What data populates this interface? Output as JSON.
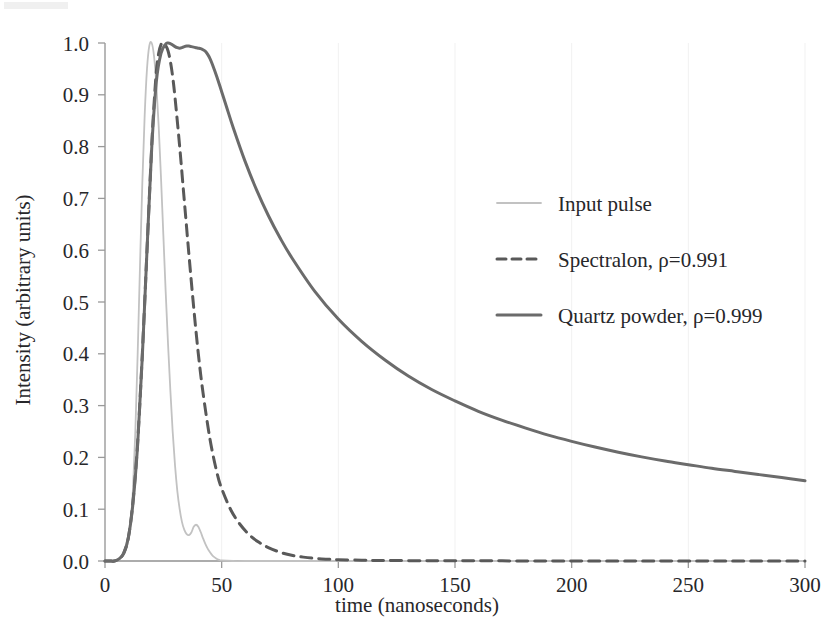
{
  "chart_data": {
    "type": "line",
    "title": "",
    "xlabel": "time (nanoseconds)",
    "ylabel": "Intensity (arbitrary units)",
    "xlim": [
      0,
      300
    ],
    "ylim": [
      0.0,
      1.0
    ],
    "grid": true,
    "legend_position": "upper right inside",
    "x_tick_labels": [
      "0",
      "50",
      "100",
      "150",
      "200",
      "250",
      "300"
    ],
    "x_ticks": [
      0,
      50,
      100,
      150,
      200,
      250,
      300
    ],
    "y_tick_labels": [
      "0.0",
      "0.1",
      "0.2",
      "0.3",
      "0.4",
      "0.5",
      "0.6",
      "0.7",
      "0.8",
      "0.9",
      "1.0"
    ],
    "y_ticks": [
      0.0,
      0.1,
      0.2,
      0.3,
      0.4,
      0.5,
      0.6,
      0.7,
      0.8,
      0.9,
      1.0
    ],
    "series": [
      {
        "name": "Input pulse",
        "style": "solid",
        "color": "#c2c2c2",
        "width": 1.8,
        "x": [
          0,
          2,
          4,
          6,
          8,
          9,
          10,
          11,
          12,
          13,
          14,
          15,
          16,
          17,
          18,
          19,
          20,
          21,
          22,
          23,
          24,
          25,
          26,
          27,
          28,
          29,
          30,
          31,
          32,
          33,
          34,
          35,
          36,
          37,
          38,
          39,
          40,
          41,
          42,
          43,
          44,
          45,
          46,
          47,
          48,
          49,
          50,
          55,
          60,
          80,
          120,
          200,
          300
        ],
        "y": [
          0.0,
          0.0,
          0.0,
          0.003,
          0.012,
          0.022,
          0.04,
          0.075,
          0.14,
          0.25,
          0.4,
          0.57,
          0.73,
          0.86,
          0.95,
          0.995,
          1.0,
          0.975,
          0.92,
          0.84,
          0.74,
          0.63,
          0.52,
          0.42,
          0.33,
          0.25,
          0.185,
          0.135,
          0.1,
          0.075,
          0.06,
          0.052,
          0.05,
          0.055,
          0.066,
          0.07,
          0.066,
          0.056,
          0.044,
          0.033,
          0.024,
          0.017,
          0.011,
          0.007,
          0.004,
          0.002,
          0.001,
          0.0,
          0.0,
          0.0,
          0.0,
          0.0,
          0.0
        ]
      },
      {
        "name": "Spectralon, ρ=0.991",
        "style": "dashed",
        "color": "#595959",
        "width": 3.0,
        "x": [
          0,
          2,
          4,
          6,
          8,
          10,
          12,
          14,
          16,
          18,
          20,
          21,
          22,
          23,
          24,
          25,
          26,
          27,
          28,
          29,
          30,
          32,
          34,
          36,
          38,
          40,
          42,
          45,
          48,
          50,
          54,
          58,
          62,
          66,
          70,
          75,
          80,
          85,
          90,
          95,
          100,
          110,
          120,
          140,
          160,
          180,
          200,
          220,
          240,
          260,
          280,
          300
        ],
        "y": [
          0.0,
          0.0,
          0.0,
          0.004,
          0.015,
          0.045,
          0.115,
          0.23,
          0.4,
          0.6,
          0.8,
          0.88,
          0.945,
          0.98,
          0.997,
          1.0,
          0.995,
          0.985,
          0.965,
          0.935,
          0.895,
          0.8,
          0.695,
          0.59,
          0.49,
          0.4,
          0.325,
          0.235,
          0.17,
          0.14,
          0.098,
          0.07,
          0.05,
          0.036,
          0.026,
          0.017,
          0.011,
          0.0075,
          0.005,
          0.0035,
          0.0025,
          0.0015,
          0.001,
          0.0005,
          0.0003,
          0.0002,
          0.0001,
          0.0001,
          0.0,
          0.0,
          0.0,
          0.0
        ]
      },
      {
        "name": "Quartz powder, ρ=0.999",
        "style": "solid",
        "color": "#6b6b6b",
        "width": 3.0,
        "x": [
          0,
          2,
          4,
          6,
          8,
          10,
          12,
          14,
          16,
          18,
          20,
          22,
          24,
          26,
          27,
          28,
          29,
          30,
          31,
          32,
          33,
          34,
          35,
          36,
          37,
          38,
          39,
          40,
          41,
          42,
          43,
          44,
          45,
          46,
          48,
          50,
          52,
          55,
          60,
          65,
          70,
          75,
          80,
          90,
          100,
          110,
          120,
          130,
          140,
          150,
          160,
          170,
          180,
          190,
          200,
          210,
          220,
          230,
          240,
          250,
          260,
          270,
          280,
          290,
          300
        ],
        "y": [
          0.0,
          0.0,
          0.0,
          0.004,
          0.015,
          0.045,
          0.112,
          0.225,
          0.395,
          0.6,
          0.795,
          0.925,
          0.98,
          0.998,
          1.0,
          0.999,
          0.996,
          0.993,
          0.991,
          0.99,
          0.991,
          0.993,
          0.994,
          0.994,
          0.993,
          0.992,
          0.991,
          0.99,
          0.989,
          0.987,
          0.984,
          0.978,
          0.97,
          0.959,
          0.934,
          0.906,
          0.878,
          0.836,
          0.772,
          0.716,
          0.667,
          0.624,
          0.586,
          0.52,
          0.467,
          0.424,
          0.388,
          0.357,
          0.331,
          0.309,
          0.289,
          0.272,
          0.257,
          0.243,
          0.231,
          0.22,
          0.21,
          0.201,
          0.193,
          0.186,
          0.179,
          0.173,
          0.167,
          0.161,
          0.155
        ]
      }
    ],
    "legend_entries": [
      {
        "label": "Input pulse",
        "style": "solid",
        "color": "#c2c2c2",
        "width": 1.8
      },
      {
        "label": "Spectralon, ρ=0.991",
        "style": "dashed",
        "color": "#595959",
        "width": 3.0
      },
      {
        "label": "Quartz powder, ρ=0.999",
        "style": "solid",
        "color": "#6b6b6b",
        "width": 3.0
      }
    ]
  }
}
